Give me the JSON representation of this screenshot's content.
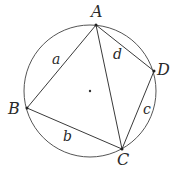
{
  "diagram": {
    "circle": {
      "cx": 90,
      "cy": 91,
      "r": 66,
      "stroke": "#555555"
    },
    "center_dot": {
      "x": 90,
      "y": 91
    },
    "vertices": {
      "A": {
        "label": "A",
        "x": 96,
        "y": 25,
        "lx": 91,
        "ly": 17
      },
      "B": {
        "label": "B",
        "x": 27,
        "y": 108,
        "lx": 8,
        "ly": 114
      },
      "C": {
        "label": "C",
        "x": 122,
        "y": 149,
        "lx": 117,
        "ly": 165
      },
      "D": {
        "label": "D",
        "x": 154,
        "y": 71,
        "lx": 156,
        "ly": 75
      }
    },
    "sides": {
      "a": {
        "label": "a",
        "from": "A",
        "to": "B",
        "lx": 53,
        "ly": 63
      },
      "b": {
        "label": "b",
        "from": "B",
        "to": "C",
        "lx": 63,
        "ly": 140
      },
      "c": {
        "label": "c",
        "from": "C",
        "to": "D",
        "lx": 143,
        "ly": 114
      },
      "d": {
        "label": "d",
        "from": "D",
        "to": "A",
        "lx": 114,
        "ly": 59
      }
    },
    "diagonal": {
      "from": "A",
      "to": "C"
    },
    "line_color": "#3a3a3a"
  }
}
